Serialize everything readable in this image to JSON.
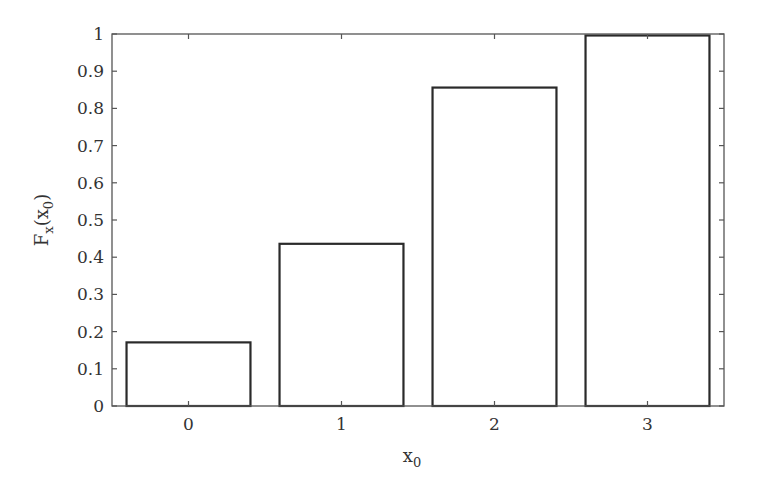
{
  "chart_data": {
    "type": "bar",
    "title": "",
    "xlabel": "x0",
    "ylabel": "Fx(x0)",
    "categories": [
      "0",
      "1",
      "2",
      "3"
    ],
    "values": [
      0.171,
      0.436,
      0.856,
      0.996
    ],
    "ylim": [
      0,
      1
    ],
    "yticks": [
      "0",
      "0.1",
      "0.2",
      "0.3",
      "0.4",
      "0.5",
      "0.6",
      "0.7",
      "0.8",
      "0.9",
      "1"
    ],
    "xticks": [
      "0",
      "1",
      "2",
      "3"
    ],
    "grid": false,
    "legend": null,
    "bar_fill": "#ffffff",
    "bar_edge": "#2a2a2a"
  },
  "labels": {
    "xlabel_main": "x",
    "xlabel_sub": "0",
    "ylabel_main": "F",
    "ylabel_sub1": "x",
    "ylabel_open": "(x",
    "ylabel_sub2": "0",
    "ylabel_close": ")"
  }
}
